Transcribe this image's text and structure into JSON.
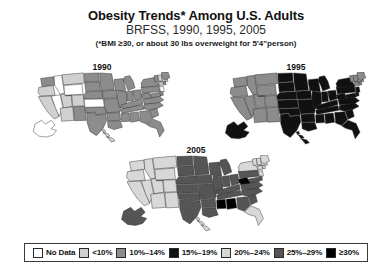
{
  "header": {
    "title": "Obesity Trends* Among U.S. Adults",
    "subtitle": "BRFSS, 1990, 1995, 2005",
    "footnote": "(*BMI ≥30, or about 30 lbs overweight for 5'4\"person)"
  },
  "maps": [
    {
      "id": "1990",
      "year_label": "1990"
    },
    {
      "id": "1995",
      "year_label": "1995"
    },
    {
      "id": "2005",
      "year_label": "2005"
    }
  ],
  "legend": {
    "items": [
      {
        "label": "No Data",
        "color": "#ffffff"
      },
      {
        "label": "<10%",
        "color": "#d0d0d0"
      },
      {
        "label": "10%–14%",
        "color": "#8c8c8c"
      },
      {
        "label": "15%–19%",
        "color": "#111111"
      },
      {
        "label": "20%–24%",
        "color": "#d8d8d8"
      },
      {
        "label": "25%–29%",
        "color": "#555555"
      },
      {
        "label": "≥30%",
        "color": "#000000"
      }
    ]
  },
  "chart_data": {
    "type": "heatmap",
    "title": "Obesity Trends* Among U.S. Adults",
    "subtitle": "BRFSS, 1990, 1995, 2005",
    "annotations": [
      "(*BMI ≥30, or about 30 lbs overweight for 5'4\"person)"
    ],
    "legend_position": "bottom",
    "categories": [
      "No Data",
      "<10%",
      "10%–14%",
      "15%–19%",
      "20%–24%",
      "25%–29%",
      "≥30%"
    ],
    "category_colors": [
      "#ffffff",
      "#d0d0d0",
      "#8c8c8c",
      "#111111",
      "#d8d8d8",
      "#555555",
      "#000000"
    ],
    "series": [
      {
        "name": "1990",
        "values": {
          "AK": "No Data",
          "AL": "10%–14%",
          "AR": "10%–14%",
          "AZ": "<10%",
          "CA": "<10%",
          "CO": "<10%",
          "CT": "<10%",
          "DE": "10%–14%",
          "FL": "10%–14%",
          "GA": "10%–14%",
          "HI": "<10%",
          "IA": "10%–14%",
          "ID": "No Data",
          "IL": "10%–14%",
          "IN": "10%–14%",
          "KS": "No Data",
          "KY": "10%–14%",
          "LA": "10%–14%",
          "MA": "<10%",
          "MD": "10%–14%",
          "ME": "10%–14%",
          "MI": "10%–14%",
          "MN": "10%–14%",
          "MO": "10%–14%",
          "MS": "10%–14%",
          "MT": "<10%",
          "NC": "10%–14%",
          "ND": "10%–14%",
          "NE": "10%–14%",
          "NH": "<10%",
          "NJ": "No Data",
          "NM": "10%–14%",
          "NV": "No Data",
          "NY": "10%–14%",
          "OH": "10%–14%",
          "OK": "10%–14%",
          "OR": "<10%",
          "PA": "10%–14%",
          "RI": "10%–14%",
          "SC": "10%–14%",
          "SD": "10%–14%",
          "TN": "10%–14%",
          "TX": "10%–14%",
          "UT": "<10%",
          "VA": "10%–14%",
          "VT": "10%–14%",
          "WA": "10%–14%",
          "WI": "10%–14%",
          "WV": "10%–14%",
          "WY": "No Data"
        }
      },
      {
        "name": "1995",
        "values": {
          "AK": "15%–19%",
          "AL": "15%–19%",
          "AR": "15%–19%",
          "AZ": "10%–14%",
          "CA": "10%–14%",
          "CO": "10%–14%",
          "CT": "10%–14%",
          "DE": "15%–19%",
          "FL": "15%–19%",
          "GA": "15%–19%",
          "HI": "15%–19%",
          "IA": "15%–19%",
          "ID": "10%–14%",
          "IL": "15%–19%",
          "IN": "15%–19%",
          "KS": "15%–19%",
          "KY": "15%–19%",
          "LA": "15%–19%",
          "MA": "10%–14%",
          "MD": "15%–19%",
          "ME": "10%–14%",
          "MI": "15%–19%",
          "MN": "15%–19%",
          "MO": "15%–19%",
          "MS": "15%–19%",
          "MT": "10%–14%",
          "NC": "15%–19%",
          "ND": "15%–19%",
          "NE": "15%–19%",
          "NH": "10%–14%",
          "NJ": "15%–19%",
          "NM": "10%–14%",
          "NV": "10%–14%",
          "NY": "15%–19%",
          "OH": "15%–19%",
          "OK": "15%–19%",
          "OR": "10%–14%",
          "PA": "15%–19%",
          "RI": "10%–14%",
          "SC": "15%–19%",
          "SD": "15%–19%",
          "TN": "15%–19%",
          "TX": "15%–19%",
          "UT": "10%–14%",
          "VA": "15%–19%",
          "VT": "10%–14%",
          "WA": "10%–14%",
          "WI": "15%–19%",
          "WV": "15%–19%",
          "WY": "10%–14%"
        }
      },
      {
        "name": "2005",
        "values": {
          "AK": "25%–29%",
          "AL": "≥30%",
          "AR": "25%–29%",
          "AZ": "20%–24%",
          "CA": "20%–24%",
          "CO": "20%–24%",
          "CT": "20%–24%",
          "DE": "25%–29%",
          "FL": "20%–24%",
          "GA": "25%–29%",
          "HI": "20%–24%",
          "IA": "25%–29%",
          "ID": "20%–24%",
          "IL": "25%–29%",
          "IN": "25%–29%",
          "KS": "25%–29%",
          "KY": "25%–29%",
          "LA": "25%–29%",
          "MA": "20%–24%",
          "MD": "25%–29%",
          "ME": "20%–24%",
          "MI": "25%–29%",
          "MN": "25%–29%",
          "MO": "25%–29%",
          "MS": "≥30%",
          "MT": "20%–24%",
          "NC": "25%–29%",
          "ND": "25%–29%",
          "NE": "25%–29%",
          "NH": "20%–24%",
          "NJ": "20%–24%",
          "NM": "20%–24%",
          "NV": "20%–24%",
          "NY": "20%–24%",
          "OH": "25%–29%",
          "OK": "25%–29%",
          "OR": "20%–24%",
          "PA": "25%–29%",
          "RI": "20%–24%",
          "SC": "25%–29%",
          "SD": "25%–29%",
          "TN": "25%–29%",
          "TX": "25%–29%",
          "UT": "20%–24%",
          "VA": "25%–29%",
          "VT": "20%–24%",
          "WA": "20%–24%",
          "WI": "25%–29%",
          "WV": "≥30%",
          "WY": "20%–24%"
        }
      }
    ]
  }
}
